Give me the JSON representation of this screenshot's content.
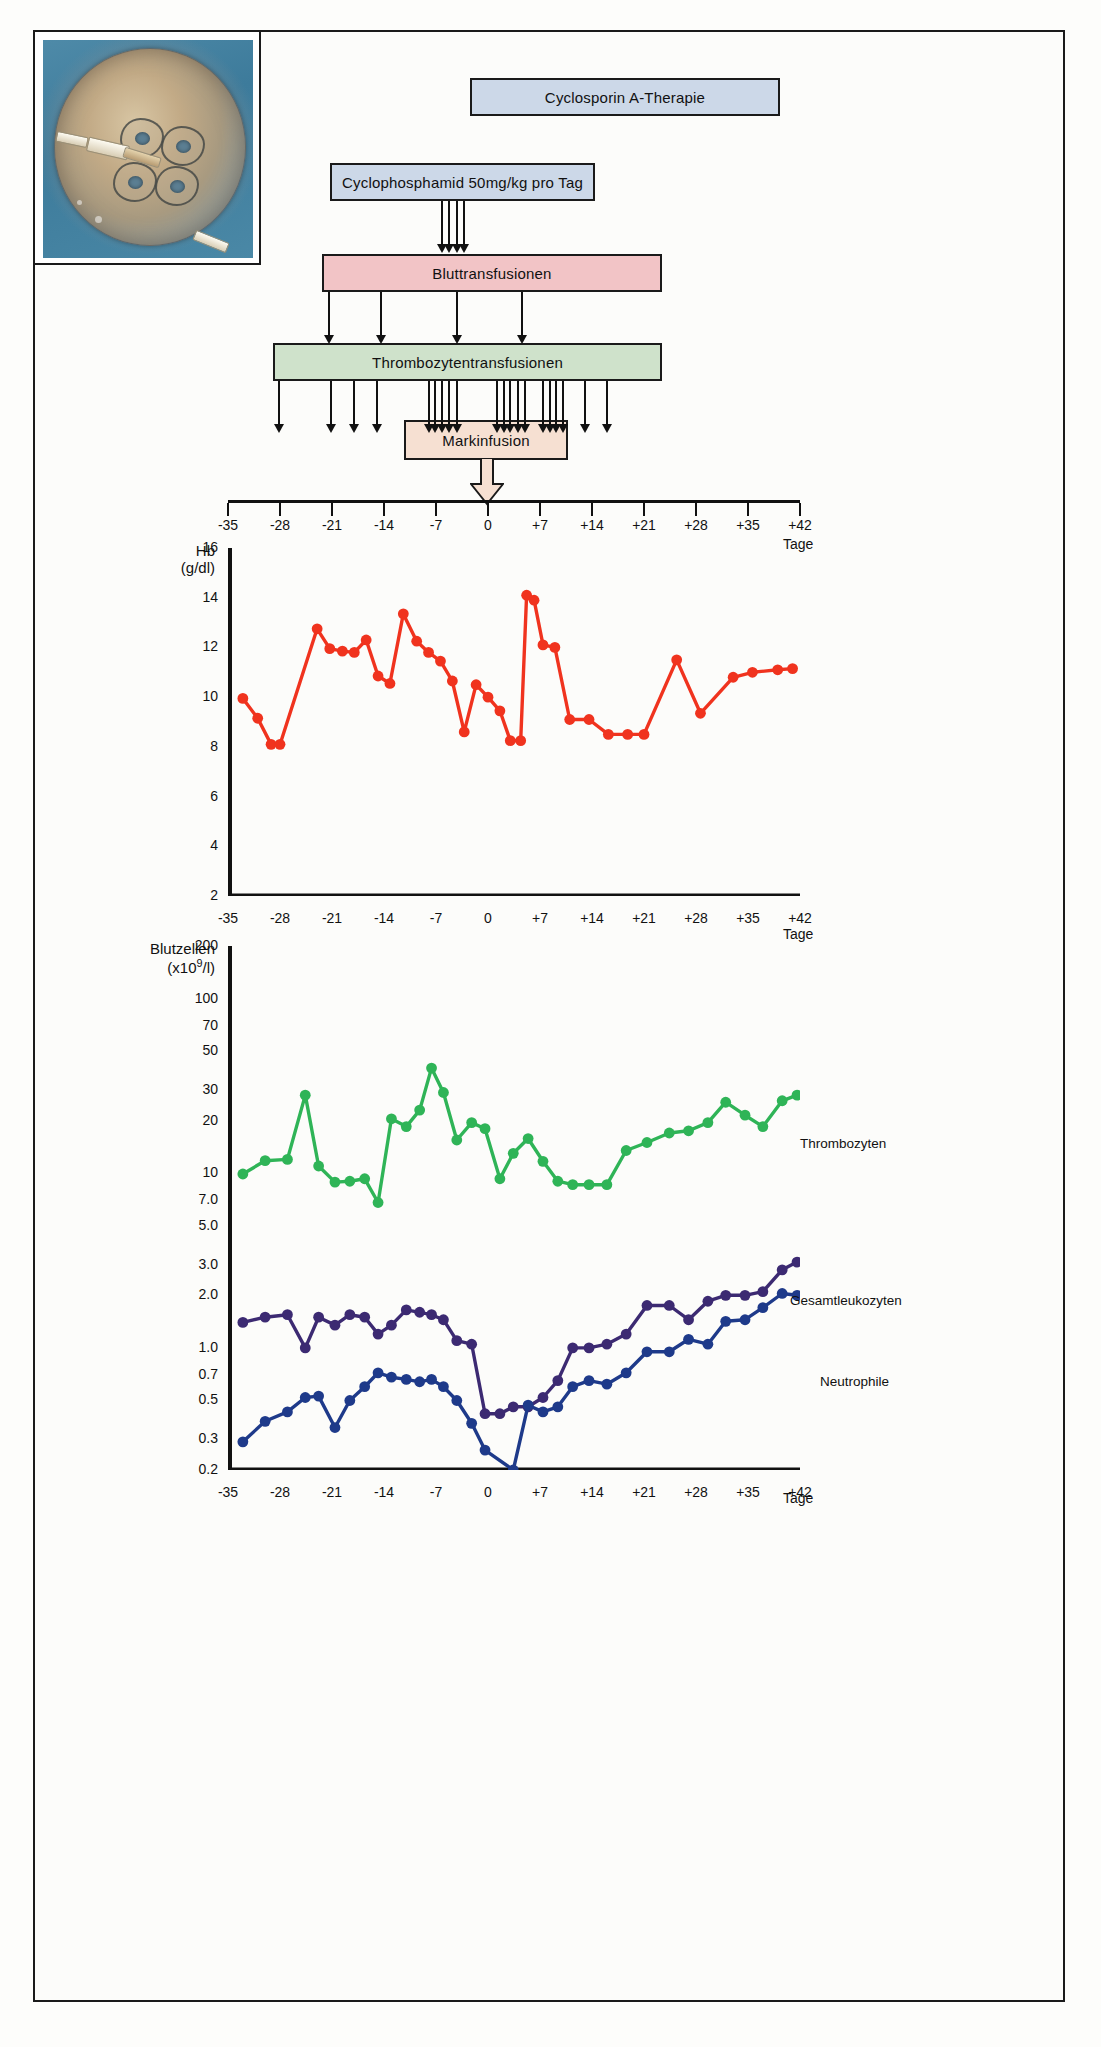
{
  "figure": {
    "photo_alt": "bone-marrow-collection-bag-photo"
  },
  "treatment_boxes": [
    {
      "id": "cyclosporin",
      "label": "Cyclosporin A-Therapie",
      "color": "#ccd8e8"
    },
    {
      "id": "cyclophosphamid",
      "label": "Cyclophosphamid 50mg/kg pro Tag",
      "color": "#ccd8e8"
    },
    {
      "id": "bluttransfusionen",
      "label": "Bluttransfusionen",
      "color": "#f2c4c6"
    },
    {
      "id": "thrombozytentransfusionen",
      "label": "Thrombozytentransfusionen",
      "color": "#cfe2cb"
    },
    {
      "id": "markinfusion",
      "label": "Markinfusion",
      "color": "#f6e0d2"
    }
  ],
  "day_axis": {
    "ticks": [
      "-35",
      "-28",
      "-21",
      "-14",
      "-7",
      "0",
      "+7",
      "+14",
      "+21",
      "+28",
      "+35",
      "+42"
    ],
    "values": [
      -35,
      -28,
      -21,
      -14,
      -7,
      0,
      7,
      14,
      21,
      28,
      35,
      42
    ],
    "unit_label": "Tage"
  },
  "event_marks": {
    "cyclophosphamid_days": [
      -6.2,
      -5.2,
      -4.2,
      -3.2
    ],
    "bluttransfusion_days": [
      -21.4,
      -14.4,
      -4.2,
      4.6
    ],
    "thrombozyten_days": [
      -28.2,
      -21.2,
      -18.0,
      -15.0,
      -8.0,
      -7.1,
      -6.2,
      -5.2,
      -4.2,
      1.2,
      2.1,
      3.0,
      4.0,
      5.0,
      7.4,
      8.3,
      9.2,
      10.1,
      13.0,
      16.0
    ]
  },
  "chart_data": [
    {
      "type": "line",
      "id": "hb-chart",
      "title": "",
      "ylabel": "Hb\n(g/dl)",
      "ylabel_line1": "Hb",
      "ylabel_line2": "(g/dl)",
      "xlabel": "Tage",
      "ylim": [
        2,
        16
      ],
      "yticks": [
        2,
        4,
        6,
        8,
        10,
        12,
        14,
        16
      ],
      "ytick_labels": [
        "2",
        "4",
        "6",
        "8",
        "10",
        "12",
        "14",
        "16"
      ],
      "xlim": [
        -35,
        42
      ],
      "grid": false,
      "series": [
        {
          "name": "Hb",
          "color": "#f0331e",
          "x": [
            -33.0,
            -31.0,
            -29.2,
            -28.0,
            -23.0,
            -21.3,
            -19.6,
            -18.0,
            -16.4,
            -14.8,
            -13.2,
            -11.4,
            -9.6,
            -8.0,
            -6.4,
            -4.8,
            -3.2,
            -1.6,
            0.0,
            1.6,
            3.0,
            4.4,
            5.2,
            6.2,
            7.4,
            9.0,
            11.0,
            13.6,
            16.2,
            18.8,
            21.0,
            25.4,
            28.6,
            33.0,
            35.6,
            39.0,
            41.0
          ],
          "y": [
            9.95,
            9.15,
            8.1,
            8.1,
            12.75,
            11.95,
            11.85,
            11.8,
            12.3,
            10.85,
            10.55,
            13.35,
            12.25,
            11.8,
            11.45,
            10.65,
            8.6,
            10.5,
            10.0,
            9.45,
            8.25,
            8.25,
            14.1,
            13.9,
            12.1,
            12.0,
            9.1,
            9.1,
            8.5,
            8.5,
            8.5,
            11.5,
            9.35,
            10.8,
            11.0,
            11.1,
            11.15
          ]
        }
      ]
    },
    {
      "type": "line",
      "id": "blood-cells-chart",
      "title": "",
      "ylabel_line1": "Blutzellen",
      "ylabel_line2": "(x10⁹/l)",
      "xlabel": "Tage",
      "yscale": "log",
      "ylim": [
        0.2,
        200
      ],
      "yticks": [
        0.2,
        0.3,
        0.5,
        0.7,
        1.0,
        2.0,
        3.0,
        5.0,
        7.0,
        10,
        20,
        30,
        50,
        70,
        100,
        200
      ],
      "ytick_labels": [
        "0.2",
        "0.3",
        "0.5",
        "0.7",
        "1.0",
        "2.0",
        "3.0",
        "5.0",
        "7.0",
        "10",
        "20",
        "30",
        "50",
        "70",
        "100",
        "200"
      ],
      "xlim": [
        -35,
        42
      ],
      "grid": false,
      "annotations": [
        {
          "text": "Thrombozyten",
          "x": 30,
          "y": 40,
          "color": "#2fb457"
        },
        {
          "text": "Gesamtleukozyten",
          "x": 31,
          "y": 4.3,
          "color": "#3c2a72"
        },
        {
          "text": "Neutrophile",
          "x": 33,
          "y": 1.05,
          "color": "#1e3a8a"
        }
      ],
      "series": [
        {
          "name": "Thrombozyten",
          "color": "#2fb457",
          "x": [
            -33.0,
            -30.0,
            -27.0,
            -24.6,
            -22.8,
            -20.6,
            -18.6,
            -16.6,
            -14.8,
            -13.0,
            -11.0,
            -9.2,
            -7.6,
            -6.0,
            -4.2,
            -2.2,
            -0.4,
            1.6,
            3.4,
            5.4,
            7.4,
            9.4,
            11.4,
            13.6,
            16.0,
            18.6,
            21.4,
            24.4,
            27.0,
            29.6,
            32.0,
            34.6,
            37.0,
            39.6,
            41.6
          ],
          "y": [
            9.9,
            11.8,
            12.0,
            28.0,
            11.0,
            8.9,
            9.0,
            9.3,
            6.8,
            20.5,
            18.5,
            23.0,
            40.0,
            29.0,
            15.5,
            19.5,
            18.0,
            9.3,
            13.0,
            15.8,
            11.7,
            9.0,
            8.6,
            8.6,
            8.6,
            13.5,
            15.0,
            17.0,
            17.5,
            19.5,
            25.5,
            21.5,
            18.5,
            26.0,
            28.0
          ]
        },
        {
          "name": "Gesamtleukozyten",
          "color": "#3c2a72",
          "x": [
            -33.0,
            -30.0,
            -27.0,
            -24.6,
            -22.8,
            -20.6,
            -18.6,
            -16.6,
            -14.8,
            -13.0,
            -11.0,
            -9.2,
            -7.6,
            -6.0,
            -4.2,
            -2.2,
            -0.4,
            1.6,
            3.4,
            5.4,
            7.4,
            9.4,
            11.4,
            13.6,
            16.0,
            18.6,
            21.4,
            24.4,
            27.0,
            29.6,
            32.0,
            34.6,
            37.0,
            39.6,
            41.6
          ],
          "y": [
            1.4,
            1.5,
            1.55,
            1.0,
            1.5,
            1.35,
            1.55,
            1.5,
            1.2,
            1.35,
            1.65,
            1.6,
            1.55,
            1.45,
            1.1,
            1.05,
            0.42,
            0.42,
            0.46,
            0.46,
            0.52,
            0.65,
            1.0,
            1.0,
            1.05,
            1.2,
            1.75,
            1.75,
            1.45,
            1.85,
            2.0,
            2.0,
            2.1,
            2.8,
            3.1
          ]
        },
        {
          "name": "Neutrophile",
          "color": "#1e3a8a",
          "x": [
            -33.0,
            -30.0,
            -27.0,
            -24.6,
            -22.8,
            -20.6,
            -18.6,
            -16.6,
            -14.8,
            -13.0,
            -11.0,
            -9.2,
            -7.6,
            -6.0,
            -4.2,
            -2.2,
            -0.4,
            3.4,
            5.4,
            7.4,
            9.4,
            11.4,
            13.6,
            16.0,
            18.6,
            21.4,
            24.4,
            27.0,
            29.6,
            32.0,
            34.6,
            37.0,
            39.6,
            41.6
          ],
          "y": [
            0.29,
            0.38,
            0.43,
            0.52,
            0.53,
            0.35,
            0.5,
            0.6,
            0.72,
            0.68,
            0.66,
            0.64,
            0.66,
            0.6,
            0.5,
            0.37,
            0.26,
            0.2,
            0.47,
            0.43,
            0.46,
            0.6,
            0.65,
            0.62,
            0.72,
            0.95,
            0.95,
            1.12,
            1.05,
            1.42,
            1.45,
            1.7,
            2.05,
            2.0
          ]
        }
      ]
    }
  ]
}
